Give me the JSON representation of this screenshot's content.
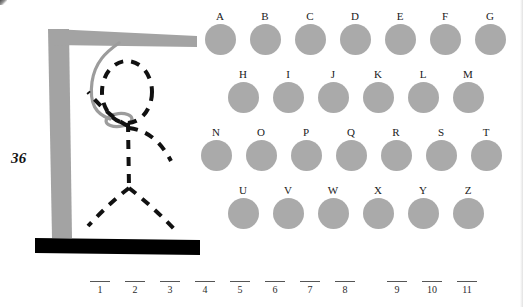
{
  "page": {
    "number": "36",
    "background_color": "#ffffff"
  },
  "gallows": {
    "post_color": "#a3a3a3",
    "beam_color": "#a3a3a3",
    "base_color": "#000000",
    "rope_color": "#9c9c9c",
    "figure_color": "#111111",
    "figure_style": "dashed",
    "parts_drawn": [
      "head",
      "rope",
      "torso",
      "left-arm",
      "right-arm",
      "left-leg",
      "right-leg"
    ]
  },
  "alphabet": {
    "circle_color": "#aaaaaa",
    "rows": [
      {
        "indent": 4,
        "letters": [
          {
            "label": "A",
            "x": 0
          },
          {
            "label": "B",
            "x": 45
          },
          {
            "label": "C",
            "x": 90
          },
          {
            "label": "D",
            "x": 135
          },
          {
            "label": "E",
            "x": 180
          },
          {
            "label": "F",
            "x": 225
          },
          {
            "label": "G",
            "x": 270
          }
        ]
      },
      {
        "indent": 27,
        "letters": [
          {
            "label": "H",
            "x": 0
          },
          {
            "label": "I",
            "x": 45
          },
          {
            "label": "J",
            "x": 90
          },
          {
            "label": "K",
            "x": 135
          },
          {
            "label": "L",
            "x": 180
          },
          {
            "label": "M",
            "x": 225
          }
        ]
      },
      {
        "indent": 0,
        "letters": [
          {
            "label": "N",
            "x": 0
          },
          {
            "label": "O",
            "x": 45
          },
          {
            "label": "P",
            "x": 90
          },
          {
            "label": "Q",
            "x": 135
          },
          {
            "label": "R",
            "x": 180
          },
          {
            "label": "S",
            "x": 225
          },
          {
            "label": "T",
            "x": 270
          }
        ]
      },
      {
        "indent": 27,
        "letters": [
          {
            "label": "U",
            "x": 0
          },
          {
            "label": "V",
            "x": 45
          },
          {
            "label": "W",
            "x": 90
          },
          {
            "label": "X",
            "x": 135
          },
          {
            "label": "Y",
            "x": 180
          },
          {
            "label": "Z",
            "x": 225
          }
        ]
      }
    ]
  },
  "answer_blanks": {
    "slots": [
      {
        "number": "1",
        "x": 0,
        "value": ""
      },
      {
        "number": "2",
        "x": 35,
        "value": ""
      },
      {
        "number": "3",
        "x": 70,
        "value": ""
      },
      {
        "number": "4",
        "x": 105,
        "value": ""
      },
      {
        "number": "5",
        "x": 140,
        "value": ""
      },
      {
        "number": "6",
        "x": 175,
        "value": ""
      },
      {
        "number": "7",
        "x": 210,
        "value": ""
      },
      {
        "number": "8",
        "x": 245,
        "value": ""
      },
      {
        "number": "9",
        "x": 297,
        "value": ""
      },
      {
        "number": "10",
        "x": 332,
        "value": ""
      },
      {
        "number": "11",
        "x": 367,
        "value": ""
      }
    ],
    "word_break_after": 8
  }
}
